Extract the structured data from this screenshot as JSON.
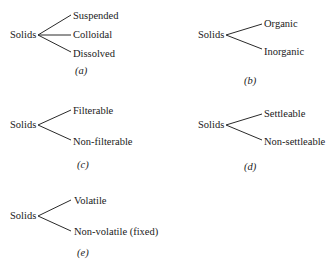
{
  "diagrams": [
    {
      "id": "a",
      "root": "Solids",
      "children": [
        "Suspended",
        "Colloidal",
        "Dissolved"
      ],
      "caption": "(a)"
    },
    {
      "id": "b",
      "root": "Solids",
      "children": [
        "Organic",
        "Inorganic"
      ],
      "caption": "(b)"
    },
    {
      "id": "c",
      "root": "Solids",
      "children": [
        "Filterable",
        "Non-filterable"
      ],
      "caption": "(c)"
    },
    {
      "id": "d",
      "root": "Solids",
      "children": [
        "Settleable",
        "Non-settleable"
      ],
      "caption": "(d)"
    },
    {
      "id": "e",
      "root": "Solids",
      "children": [
        "Volatile",
        "Non-volatile (fixed)"
      ],
      "caption": "(e)"
    }
  ]
}
